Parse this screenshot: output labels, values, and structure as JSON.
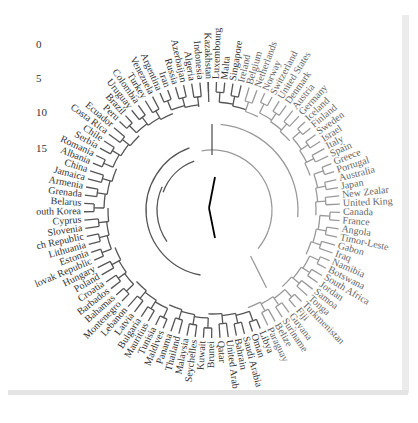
{
  "figure": {
    "type": "circular-dendrogram",
    "center": [
      212,
      210
    ],
    "scale_labels": [
      "0",
      "5",
      "10",
      "15"
    ],
    "colors": {
      "cluster_dark": "#555555",
      "cluster_light": "#9a9a9a",
      "root": "#000000",
      "label": "#444444"
    },
    "leaves": [
      {
        "label": "Luxembourg",
        "group": "dark"
      },
      {
        "label": "Malta",
        "group": "dark"
      },
      {
        "label": "Singapore",
        "group": "dark"
      },
      {
        "label": "Ireland",
        "group": "light"
      },
      {
        "label": "Belgium",
        "group": "light"
      },
      {
        "label": "Netherlands",
        "group": "light"
      },
      {
        "label": "Norway",
        "group": "light"
      },
      {
        "label": "Switzerland",
        "group": "light"
      },
      {
        "label": "United States",
        "group": "light"
      },
      {
        "label": "Denmark",
        "group": "light"
      },
      {
        "label": "Austria",
        "group": "light"
      },
      {
        "label": "Germany",
        "group": "light"
      },
      {
        "label": "Iceland",
        "group": "light"
      },
      {
        "label": "Finland",
        "group": "light"
      },
      {
        "label": "Sweden",
        "group": "light"
      },
      {
        "label": "Israel",
        "group": "light"
      },
      {
        "label": "Italy",
        "group": "light"
      },
      {
        "label": "Spain",
        "group": "light"
      },
      {
        "label": "Greece",
        "group": "light"
      },
      {
        "label": "Portugal",
        "group": "light"
      },
      {
        "label": "Australia",
        "group": "light"
      },
      {
        "label": "Japan",
        "group": "light"
      },
      {
        "label": "New Zealar",
        "group": "light"
      },
      {
        "label": "United King",
        "group": "light"
      },
      {
        "label": "Canada",
        "group": "light"
      },
      {
        "label": "France",
        "group": "light"
      },
      {
        "label": "Angola",
        "group": "light"
      },
      {
        "label": "Timor-Leste",
        "group": "light"
      },
      {
        "label": "Gabon",
        "group": "light"
      },
      {
        "label": "Iraq",
        "group": "light"
      },
      {
        "label": "Namibia",
        "group": "light"
      },
      {
        "label": "Botswana",
        "group": "light"
      },
      {
        "label": "South Africa",
        "group": "light"
      },
      {
        "label": "Jordan",
        "group": "light"
      },
      {
        "label": "Samoa",
        "group": "light"
      },
      {
        "label": "Tonga",
        "group": "light"
      },
      {
        "label": "Turkmenistan",
        "group": "light"
      },
      {
        "label": "Fiji",
        "group": "light"
      },
      {
        "label": "Guyana",
        "group": "light"
      },
      {
        "label": "Suriname",
        "group": "light"
      },
      {
        "label": "Belize",
        "group": "light"
      },
      {
        "label": "Paraguay",
        "group": "light"
      },
      {
        "label": "Libya",
        "group": "dark"
      },
      {
        "label": "Oman",
        "group": "dark"
      },
      {
        "label": "Saudi Arabia",
        "group": "dark"
      },
      {
        "label": "Bahrain",
        "group": "dark"
      },
      {
        "label": "United Arab",
        "group": "dark"
      },
      {
        "label": "Qatar",
        "group": "dark"
      },
      {
        "label": "Brunei",
        "group": "dark"
      },
      {
        "label": "Kuwait",
        "group": "dark"
      },
      {
        "label": "Seychelles",
        "group": "dark"
      },
      {
        "label": "Malaysia",
        "group": "dark"
      },
      {
        "label": "Thailand",
        "group": "dark"
      },
      {
        "label": "Panama",
        "group": "dark"
      },
      {
        "label": "Maldives",
        "group": "dark"
      },
      {
        "label": "Tunisia",
        "group": "dark"
      },
      {
        "label": "Mauritius",
        "group": "dark"
      },
      {
        "label": "Bulgaria",
        "group": "dark"
      },
      {
        "label": "Latvia",
        "group": "dark"
      },
      {
        "label": "Lebanon",
        "group": "dark"
      },
      {
        "label": "Montenegro",
        "group": "dark"
      },
      {
        "label": "Bahamas",
        "group": "dark"
      },
      {
        "label": "Barbados",
        "group": "dark"
      },
      {
        "label": "Croatia",
        "group": "dark"
      },
      {
        "label": "Poland",
        "group": "dark"
      },
      {
        "label": "Hungary",
        "group": "dark"
      },
      {
        "label": "lovak Republic",
        "group": "dark"
      },
      {
        "label": "Estonia",
        "group": "dark"
      },
      {
        "label": "Lithuania",
        "group": "dark"
      },
      {
        "label": "ch Republic",
        "group": "dark"
      },
      {
        "label": "Slovenia",
        "group": "dark"
      },
      {
        "label": "Cyprus",
        "group": "dark"
      },
      {
        "label": "outh Korea",
        "group": "dark"
      },
      {
        "label": "Belarus",
        "group": "dark"
      },
      {
        "label": "Grenada",
        "group": "dark"
      },
      {
        "label": "Armenia",
        "group": "dark"
      },
      {
        "label": "Jamaica",
        "group": "dark"
      },
      {
        "label": "China",
        "group": "dark"
      },
      {
        "label": "Albania",
        "group": "dark"
      },
      {
        "label": "Romania",
        "group": "dark"
      },
      {
        "label": "Serbia",
        "group": "dark"
      },
      {
        "label": "Chile",
        "group": "dark"
      },
      {
        "label": "Costa Rica",
        "group": "dark"
      },
      {
        "label": "Ecuador",
        "group": "dark"
      },
      {
        "label": "Peru",
        "group": "dark"
      },
      {
        "label": "Brazil",
        "group": "dark"
      },
      {
        "label": "Uruguay",
        "group": "dark"
      },
      {
        "label": "Colombia",
        "group": "dark"
      },
      {
        "label": "Turkey",
        "group": "dark"
      },
      {
        "label": "Venezuela",
        "group": "dark"
      },
      {
        "label": "Argentina",
        "group": "dark"
      },
      {
        "label": "Iran",
        "group": "dark"
      },
      {
        "label": "Russia",
        "group": "dark"
      },
      {
        "label": "Azerbaijan",
        "group": "dark"
      },
      {
        "label": "Algeria",
        "group": "dark"
      },
      {
        "label": "Indonesia",
        "group": "dark"
      },
      {
        "label": "Kazakhstan",
        "group": "dark"
      }
    ]
  }
}
